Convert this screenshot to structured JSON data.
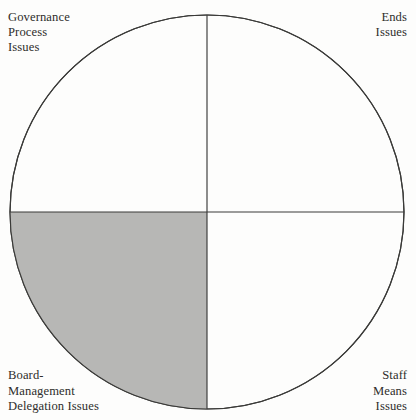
{
  "diagram": {
    "type": "quadrant-circle",
    "geometry": {
      "center_x": 207,
      "center_y": 212,
      "radius": 197,
      "vertical_divider_x": 207,
      "horizontal_divider_y": 212
    },
    "colors": {
      "background": "#fdfdfc",
      "stroke": "#3a3a38",
      "shaded_quadrant_fill": "#b7b7b5",
      "unshaded_quadrant_fill": "#fdfdfc",
      "text": "#2e2d2b"
    },
    "quadrants": [
      {
        "id": "top-left",
        "position": "top-left",
        "shaded": false,
        "fill": "#fdfdfc",
        "label_lines": [
          "Governance",
          "Process",
          "Issues"
        ]
      },
      {
        "id": "top-right",
        "position": "top-right",
        "shaded": false,
        "fill": "#fdfdfc",
        "label_lines": [
          "Ends",
          "Issues"
        ]
      },
      {
        "id": "bottom-left",
        "position": "bottom-left",
        "shaded": true,
        "fill": "#b7b7b5",
        "label_lines": [
          "Board-",
          "Management",
          "Delegation Issues"
        ]
      },
      {
        "id": "bottom-right",
        "position": "bottom-right",
        "shaded": false,
        "fill": "#fdfdfc",
        "label_lines": [
          "Staff",
          "Means",
          "Issues"
        ]
      }
    ]
  }
}
